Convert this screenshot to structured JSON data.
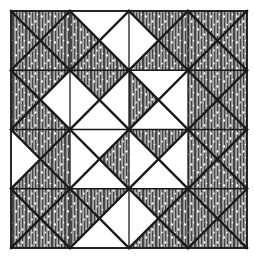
{
  "figure": {
    "kind": "line-drawing",
    "background_color": "#ffffff",
    "ink_color": "#1a1a1a",
    "shade_fill_color": "#9a9a9a",
    "shade_stripe_color": "#3c3c3c",
    "dot_color": "#ffffff",
    "canvas": {
      "width": 254,
      "height": 259
    }
  },
  "block": {
    "frame": {
      "x": 11,
      "y": 11,
      "width": 236,
      "height": 237,
      "border_width": 1.6,
      "label": "outer block border"
    },
    "grid": {
      "rows": 4,
      "cols": 4,
      "cell_width": 59,
      "cell_height": 59.25,
      "line_width": 1.3,
      "x_lines": [
        11,
        70,
        129,
        188,
        247
      ],
      "y_lines": [
        11,
        70.25,
        129.5,
        188.75,
        248
      ]
    },
    "diagonal_line_width": 2.4,
    "notes": "Each square cell is split by both diagonals into four triangles named n (north/top), e (east/right), s (south/bottom), w (west/left). A value of 1 means the triangle is shaded with vertical hatching and white speckles; 0 means plain white."
  },
  "pattern": {
    "legend": {
      "shaded": "shaded triangle (vertical hatch + speckle)",
      "plain": "plain white triangle"
    },
    "cells": [
      [
        {
          "row": 0,
          "col": 0,
          "n": 1,
          "e": 1,
          "s": 1,
          "w": 1
        },
        {
          "row": 0,
          "col": 1,
          "n": 0,
          "e": 0,
          "s": 1,
          "w": 1
        },
        {
          "row": 0,
          "col": 2,
          "n": 1,
          "e": 1,
          "s": 1,
          "w": 0
        },
        {
          "row": 0,
          "col": 3,
          "n": 1,
          "e": 1,
          "s": 1,
          "w": 1
        }
      ],
      [
        {
          "row": 1,
          "col": 0,
          "n": 1,
          "e": 0,
          "s": 1,
          "w": 1
        },
        {
          "row": 1,
          "col": 1,
          "n": 1,
          "e": 0,
          "s": 0,
          "w": 0
        },
        {
          "row": 1,
          "col": 2,
          "n": 0,
          "e": 0,
          "s": 0,
          "w": 1
        },
        {
          "row": 1,
          "col": 3,
          "n": 1,
          "e": 1,
          "s": 1,
          "w": 1
        }
      ],
      [
        {
          "row": 2,
          "col": 0,
          "n": 1,
          "e": 1,
          "s": 1,
          "w": 0
        },
        {
          "row": 2,
          "col": 1,
          "n": 0,
          "e": 1,
          "s": 0,
          "w": 0
        },
        {
          "row": 2,
          "col": 2,
          "n": 1,
          "e": 0,
          "s": 0,
          "w": 0
        },
        {
          "row": 2,
          "col": 3,
          "n": 1,
          "e": 1,
          "s": 1,
          "w": 1
        }
      ],
      [
        {
          "row": 3,
          "col": 0,
          "n": 1,
          "e": 1,
          "s": 1,
          "w": 1
        },
        {
          "row": 3,
          "col": 1,
          "n": 1,
          "e": 0,
          "s": 0,
          "w": 1
        },
        {
          "row": 3,
          "col": 2,
          "n": 1,
          "e": 1,
          "s": 1,
          "w": 0
        },
        {
          "row": 3,
          "col": 3,
          "n": 1,
          "e": 1,
          "s": 1,
          "w": 1
        }
      ]
    ]
  }
}
